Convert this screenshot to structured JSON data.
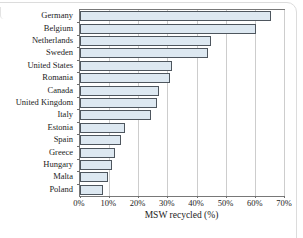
{
  "chart_data": {
    "type": "bar",
    "orientation": "horizontal",
    "title": "",
    "categories": [
      "Germany",
      "Belgium",
      "Netherlands",
      "Sweden",
      "United States",
      "Romania",
      "Canada",
      "United Kingdom",
      "Italy",
      "Estonia",
      "Spain",
      "Greece",
      "Hungary",
      "Malta",
      "Poland"
    ],
    "values": [
      65.5,
      60.5,
      45,
      44,
      31.5,
      31,
      27,
      26.5,
      24.5,
      15.5,
      14,
      12,
      11,
      9.5,
      8
    ],
    "xlabel": "MSW recycled (%)",
    "xlim": [
      0,
      70
    ],
    "xtick_step": 10,
    "xtick_labels": [
      "0%",
      "10%",
      "20%",
      "30%",
      "40%",
      "50%",
      "60%",
      "70%"
    ],
    "grid": true,
    "legend": false,
    "colors": {
      "bar_fill": "#dde8f1",
      "bar_border": "#4e565e",
      "gridline": "#cdcdcd",
      "axis": "#787878",
      "text": "#1c1c1c"
    }
  }
}
